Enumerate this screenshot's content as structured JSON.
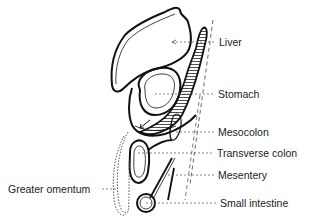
{
  "diagram": {
    "type": "anatomical cross-section",
    "labels": {
      "liver": "Liver",
      "stomach": "Stomach",
      "mesocolon": "Mesocolon",
      "transverse_colon": "Transverse colon",
      "mesentery": "Mesentery",
      "small_intestine": "Small intestine",
      "greater_omentum": "Greater omentum"
    },
    "colors": {
      "line": "#111111",
      "leader": "#555555",
      "background": "#ffffff"
    }
  }
}
